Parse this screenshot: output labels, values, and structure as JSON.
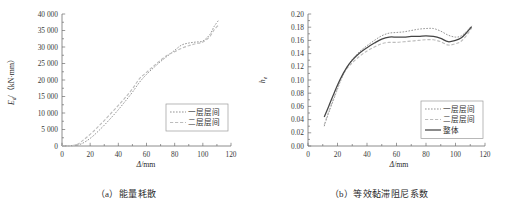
{
  "figure": {
    "panels": [
      {
        "id": "a",
        "caption": "（a）能量耗散",
        "xlabel_symbol": "Δ",
        "xlabel_unit": "/mm",
        "ylabel": "E_d/(kN·mm)",
        "ylabel_symbol": "E",
        "ylabel_sub": "d",
        "ylabel_unit": "/（kN·mm）",
        "xticks": [
          "0",
          "20",
          "40",
          "60",
          "80",
          "100",
          "120"
        ],
        "yticks": [
          "0",
          "5 000",
          "10 000",
          "15 000",
          "20 000",
          "25 000",
          "30 000",
          "35 000",
          "40 000"
        ],
        "legend": [
          {
            "label": "一层层间",
            "style": "dotted",
            "color": "#8e8e8e"
          },
          {
            "label": "二层层间",
            "style": "dashed",
            "color": "#bdbdbd"
          }
        ]
      },
      {
        "id": "b",
        "caption": "（b）等效黏滞阻尼系数",
        "xlabel_symbol": "Δ",
        "xlabel_unit": "/mm",
        "ylabel": "h_e",
        "ylabel_symbol": "h",
        "ylabel_sub": "e",
        "ylabel_unit": "",
        "xticks": [
          "0",
          "20",
          "40",
          "60",
          "80",
          "100",
          "120"
        ],
        "yticks": [
          "0.00",
          "0.02",
          "0.04",
          "0.06",
          "0.08",
          "0.10",
          "0.12",
          "0.14",
          "0.16",
          "0.18",
          "0.20"
        ],
        "legend": [
          {
            "label": "一层层间",
            "style": "dotted",
            "color": "#8e8e8e"
          },
          {
            "label": "二层层间",
            "style": "dashed",
            "color": "#bdbdbd"
          },
          {
            "label": "整体",
            "style": "solid",
            "color": "#454545"
          }
        ]
      }
    ]
  },
  "chart_data": [
    {
      "type": "line",
      "title": "（a）能量耗散",
      "xlabel": "Δ/mm",
      "ylabel": "E_d/(kN·mm)",
      "xlim": [
        0,
        120
      ],
      "ylim": [
        0,
        40000
      ],
      "xticks": [
        0,
        20,
        40,
        60,
        80,
        100,
        120
      ],
      "yticks": [
        0,
        5000,
        10000,
        15000,
        20000,
        25000,
        30000,
        35000,
        40000
      ],
      "grid": false,
      "legend_position": "lower-right",
      "series": [
        {
          "name": "一层层间",
          "style": "dotted",
          "x": [
            0,
            5,
            10,
            14,
            18,
            22,
            26,
            30,
            35,
            40,
            45,
            50,
            55,
            60,
            65,
            70,
            75,
            80,
            85,
            90,
            95,
            100,
            105,
            108,
            111
          ],
          "values": [
            0,
            60,
            200,
            700,
            1700,
            3000,
            4600,
            6300,
            8600,
            11000,
            13600,
            16300,
            19300,
            21700,
            23700,
            25600,
            27300,
            29000,
            30600,
            31200,
            31500,
            31800,
            33800,
            36200,
            38000
          ]
        },
        {
          "name": "二层层间",
          "style": "dashed",
          "x": [
            0,
            5,
            10,
            14,
            18,
            22,
            26,
            30,
            35,
            40,
            45,
            50,
            55,
            60,
            65,
            70,
            75,
            80,
            85,
            90,
            95,
            100,
            105,
            108,
            111
          ],
          "values": [
            0,
            80,
            350,
            1400,
            2800,
            4300,
            6000,
            7700,
            10000,
            12300,
            14700,
            17300,
            20400,
            22300,
            24200,
            26000,
            27600,
            28600,
            29600,
            30400,
            31000,
            31500,
            33200,
            35200,
            36600
          ]
        }
      ]
    },
    {
      "type": "line",
      "title": "（b）等效黏滞阻尼系数",
      "xlabel": "Δ/mm",
      "ylabel": "h_e",
      "xlim": [
        0,
        120
      ],
      "ylim": [
        0.0,
        0.2
      ],
      "xticks": [
        0,
        20,
        40,
        60,
        80,
        100,
        120
      ],
      "yticks": [
        0.0,
        0.02,
        0.04,
        0.06,
        0.08,
        0.1,
        0.12,
        0.14,
        0.16,
        0.18,
        0.2
      ],
      "grid": false,
      "legend_position": "lower-right",
      "series": [
        {
          "name": "一层层间",
          "style": "dotted",
          "x": [
            11,
            14,
            18,
            22,
            26,
            30,
            35,
            40,
            45,
            50,
            55,
            60,
            65,
            70,
            75,
            80,
            85,
            90,
            95,
            100,
            104,
            108,
            111
          ],
          "values": [
            0.03,
            0.05,
            0.074,
            0.098,
            0.118,
            0.131,
            0.143,
            0.152,
            0.16,
            0.167,
            0.171,
            0.172,
            0.173,
            0.175,
            0.177,
            0.178,
            0.178,
            0.174,
            0.168,
            0.165,
            0.167,
            0.175,
            0.182
          ]
        },
        {
          "name": "二层层间",
          "style": "dashed",
          "x": [
            11,
            14,
            18,
            22,
            26,
            30,
            35,
            40,
            45,
            50,
            55,
            60,
            65,
            70,
            75,
            80,
            85,
            90,
            95,
            100,
            104,
            108,
            111
          ],
          "values": [
            0.032,
            0.052,
            0.076,
            0.1,
            0.116,
            0.126,
            0.136,
            0.144,
            0.15,
            0.155,
            0.157,
            0.157,
            0.158,
            0.159,
            0.16,
            0.161,
            0.161,
            0.158,
            0.153,
            0.155,
            0.159,
            0.169,
            0.179
          ]
        },
        {
          "name": "整体",
          "style": "solid",
          "x": [
            11,
            14,
            18,
            22,
            26,
            30,
            35,
            40,
            45,
            50,
            55,
            60,
            65,
            70,
            75,
            80,
            85,
            90,
            95,
            100,
            104,
            108,
            111
          ],
          "values": [
            0.044,
            0.06,
            0.082,
            0.102,
            0.118,
            0.13,
            0.141,
            0.149,
            0.156,
            0.162,
            0.165,
            0.165,
            0.165,
            0.166,
            0.166,
            0.167,
            0.166,
            0.163,
            0.158,
            0.16,
            0.164,
            0.173,
            0.181
          ]
        }
      ]
    }
  ]
}
